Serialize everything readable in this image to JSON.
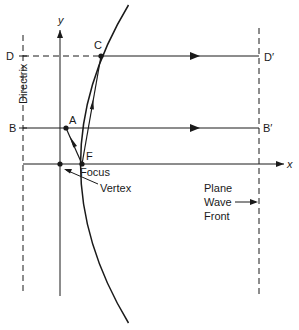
{
  "diagram": {
    "axes": {
      "x_label": "x",
      "y_label": "y"
    },
    "points": {
      "C": "C",
      "A": "A",
      "F": "F",
      "D": "D",
      "D_prime": "D′",
      "B": "B",
      "B_prime": "B′"
    },
    "labels": {
      "directrix": "Directrix",
      "focus": "Focus",
      "vertex": "Vertex",
      "wavefront_line1": "Plane",
      "wavefront_line2": "Wave",
      "wavefront_line3": "Front"
    },
    "colors": {
      "ink": "#1a1a1a",
      "background": "#ffffff"
    }
  }
}
